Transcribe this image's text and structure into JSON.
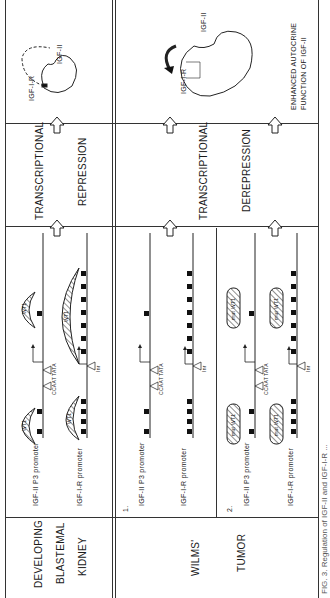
{
  "figure": {
    "caption": "FIG. 3. Regulation of IGF-II and IGF-I-R ...",
    "rows": {
      "developing": {
        "label_lines": [
          "DEVELOPING",
          "BLASTEMAL",
          "KIDNEY"
        ],
        "promoters": {
          "igf2": "IGF-II P3 promoter",
          "igf1r": "IGF-I-R promoter"
        },
        "protein": "WT1",
        "elements": {
          "ccaat": "CCAAT",
          "tata": "TATA",
          "inr": "Inr"
        },
        "transcription": [
          "TRANSCRIPTIONAL",
          "REPRESSION"
        ],
        "outcome": {
          "receptor": "IGF-I-R",
          "ligand": "IGF-II"
        }
      },
      "wilms": {
        "label_lines": [
          "WILMS'",
          "TUMOR"
        ],
        "cases": [
          {
            "number": "1.",
            "promoters": {
              "igf2": "IGF-II P3 promoter",
              "igf1r": "IGF-I-R promoter"
            }
          },
          {
            "number": "2.",
            "promoters": {
              "igf2": "IGF-II P3 promoter",
              "igf1r": "IGF-I-R promoter"
            },
            "protein": "mut WT1"
          }
        ],
        "elements": {
          "ccaat": "CCAAT",
          "tata": "TATA",
          "inr": "Inr"
        },
        "transcription": [
          "TRANSCRIPTIONAL",
          "DEREPRESSION"
        ],
        "outcome": {
          "receptor": "IGF-I-R",
          "ligand": "IGF-II",
          "description_lines": [
            "ENHANCED AUTOCRINE",
            "FUNCTION OF IGF-II"
          ]
        }
      }
    }
  }
}
